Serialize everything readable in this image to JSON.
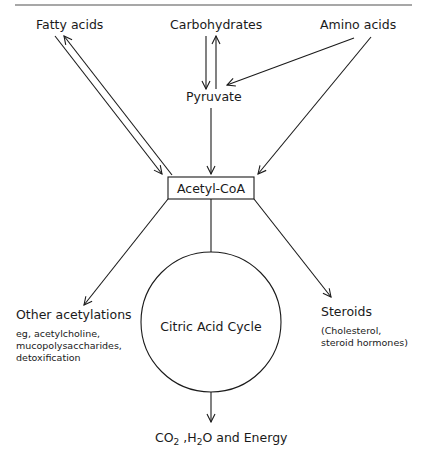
{
  "diagram": {
    "sources": {
      "fatty_acids": "Fatty acids",
      "carbohydrates": "Carbohydrates",
      "amino_acids": "Amino acids"
    },
    "intermediate": "Pyruvate",
    "hub": "Acetyl-CoA",
    "cycle": "Citric Acid Cycle",
    "outputs": {
      "other_acetylations": {
        "label": "Other acetylations",
        "detail_lines": [
          "eg, acetylcholine,",
          "mucopolysaccharides,",
          "detoxification"
        ]
      },
      "steroids": {
        "label": "Steroids",
        "detail_lines": [
          "(Cholesterol,",
          "steroid hormones)"
        ]
      },
      "final": {
        "co2": "CO",
        "co2_sub": "2",
        "sep": " ,H",
        "h2o_sub": "2",
        "rest": "O and Energy"
      }
    },
    "edges": [
      {
        "from": "Fatty acids",
        "to": "Acetyl-CoA",
        "direction": "both"
      },
      {
        "from": "Carbohydrates",
        "to": "Pyruvate",
        "direction": "both"
      },
      {
        "from": "Amino acids",
        "to": "Pyruvate",
        "direction": "forward"
      },
      {
        "from": "Amino acids",
        "to": "Acetyl-CoA",
        "direction": "forward"
      },
      {
        "from": "Pyruvate",
        "to": "Acetyl-CoA",
        "direction": "forward"
      },
      {
        "from": "Acetyl-CoA",
        "to": "Other acetylations",
        "direction": "forward"
      },
      {
        "from": "Acetyl-CoA",
        "to": "Steroids",
        "direction": "forward"
      },
      {
        "from": "Acetyl-CoA",
        "to": "Citric Acid Cycle",
        "direction": "forward"
      },
      {
        "from": "Citric Acid Cycle",
        "to": "CO2, H2O and Energy",
        "direction": "forward"
      }
    ]
  }
}
